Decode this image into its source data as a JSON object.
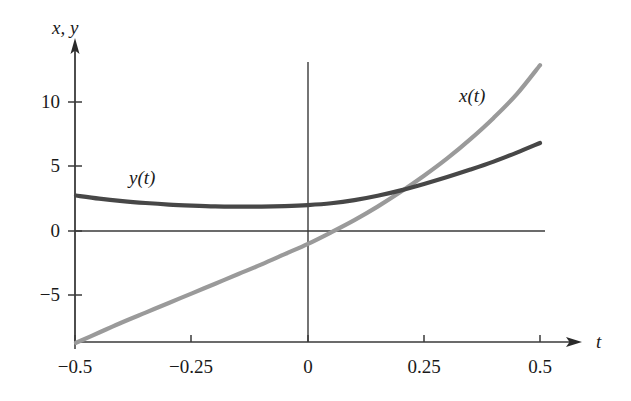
{
  "chart_data": {
    "type": "line",
    "title": "",
    "subtitle": "",
    "xlabel": "t",
    "ylabel": "x, y",
    "xlim": [
      -0.5,
      0.5
    ],
    "ylim": [
      -8.7,
      13.6
    ],
    "grid": false,
    "legend_position": "inline-annotations",
    "x_ticks": [
      -0.5,
      -0.25,
      0,
      0.25,
      0.5
    ],
    "x_tick_labels": [
      "−0.5",
      "−0.25",
      "0",
      "0.25",
      "0.5"
    ],
    "y_ticks": [
      -5,
      0,
      5,
      10
    ],
    "y_tick_labels": [
      "−5",
      "0",
      "5",
      "10"
    ],
    "series": [
      {
        "name": "x(t)",
        "label": "x(t)",
        "color": "#9a9a9a",
        "x": [
          -0.5,
          -0.45,
          -0.4,
          -0.35,
          -0.3,
          -0.25,
          -0.2,
          -0.15,
          -0.1,
          -0.05,
          0,
          0.05,
          0.1,
          0.15,
          0.2,
          0.25,
          0.3,
          0.35,
          0.4,
          0.45,
          0.5
        ],
        "values": [
          -8.7,
          -7.9,
          -7.1,
          -6.35,
          -5.6,
          -4.85,
          -4.1,
          -3.35,
          -2.6,
          -1.8,
          -1.0,
          -0.1,
          0.85,
          1.9,
          3.05,
          4.3,
          5.65,
          7.15,
          8.8,
          10.65,
          12.9
        ]
      },
      {
        "name": "y(t)",
        "label": "y(t)",
        "color": "#474747",
        "x": [
          -0.5,
          -0.45,
          -0.4,
          -0.35,
          -0.3,
          -0.25,
          -0.2,
          -0.15,
          -0.1,
          -0.05,
          0,
          0.05,
          0.1,
          0.15,
          0.2,
          0.25,
          0.3,
          0.35,
          0.4,
          0.45,
          0.5
        ],
        "values": [
          2.76,
          2.52,
          2.33,
          2.18,
          2.06,
          1.98,
          1.92,
          1.9,
          1.9,
          1.94,
          2.02,
          2.16,
          2.4,
          2.74,
          3.16,
          3.66,
          4.2,
          4.78,
          5.4,
          6.1,
          6.85
        ]
      }
    ],
    "annotations": [
      {
        "text": "y(t)",
        "x": -0.31,
        "y": 4.0
      },
      {
        "text": "x(t)",
        "x": 0.41,
        "y": 10.6
      }
    ],
    "axis_arrows": {
      "x_axis_arrow": true,
      "y_axis_arrow": true
    },
    "zero_lines": {
      "horizontal_at_y": 0,
      "vertical_at_x": 0
    }
  },
  "labels": {
    "y_axis_title": "x, y",
    "x_axis_title": "t",
    "y_tick_10": "10",
    "y_tick_5": "5",
    "y_tick_0": "0",
    "y_tick_neg5": "−5",
    "x_tick_neg05": "−0.5",
    "x_tick_neg025": "−0.25",
    "x_tick_0": "0",
    "x_tick_025": "0.25",
    "x_tick_05": "0.5",
    "curve_x_label": "x(t)",
    "curve_y_label": "y(t)"
  },
  "colors": {
    "axis": "#3a3a3a",
    "curve_x": "#9a9a9a",
    "curve_y": "#474747",
    "background": "#ffffff",
    "text": "#1a1a1a"
  }
}
